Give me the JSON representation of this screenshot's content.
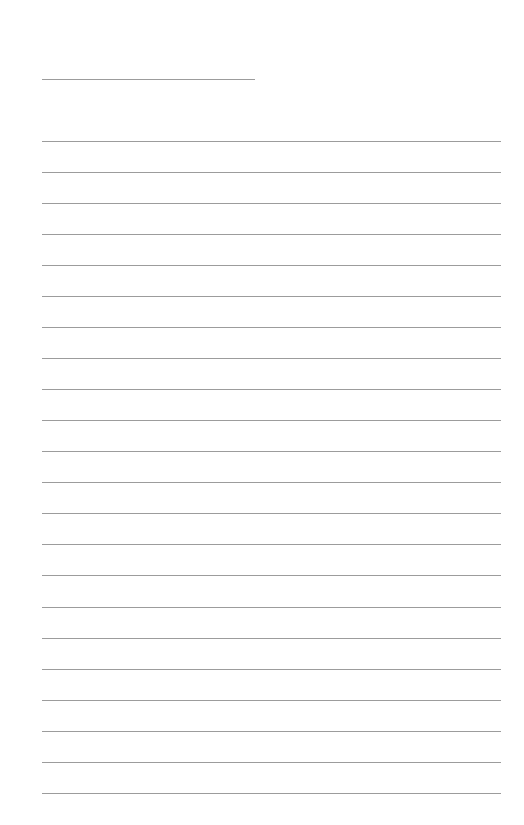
{
  "page": {
    "type": "lined-paper",
    "background_color": "#ffffff",
    "line_color": "#9c9c9c"
  },
  "header_line": {
    "label": "",
    "x": 42,
    "y": 79,
    "width": 213
  },
  "ruled_lines": {
    "count": 22,
    "x": 42,
    "width": 459,
    "first_y": 141,
    "spacing": 31,
    "lines": [
      {
        "y": 141,
        "text": ""
      },
      {
        "y": 172,
        "text": ""
      },
      {
        "y": 203,
        "text": ""
      },
      {
        "y": 234,
        "text": ""
      },
      {
        "y": 265,
        "text": ""
      },
      {
        "y": 296,
        "text": ""
      },
      {
        "y": 327,
        "text": ""
      },
      {
        "y": 358,
        "text": ""
      },
      {
        "y": 389,
        "text": ""
      },
      {
        "y": 420,
        "text": ""
      },
      {
        "y": 451,
        "text": ""
      },
      {
        "y": 482,
        "text": ""
      },
      {
        "y": 513,
        "text": ""
      },
      {
        "y": 544,
        "text": ""
      },
      {
        "y": 575,
        "text": ""
      },
      {
        "y": 607,
        "text": ""
      },
      {
        "y": 638,
        "text": ""
      },
      {
        "y": 669,
        "text": ""
      },
      {
        "y": 700,
        "text": ""
      },
      {
        "y": 731,
        "text": ""
      },
      {
        "y": 762,
        "text": ""
      },
      {
        "y": 793,
        "text": ""
      }
    ]
  }
}
